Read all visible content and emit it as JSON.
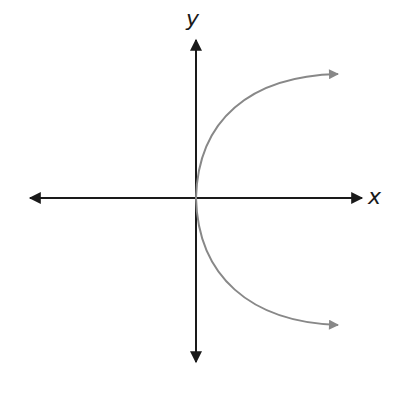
{
  "diagram": {
    "type": "graph of x = y^2 (sideways parabola)",
    "axes": {
      "x_label": "x",
      "y_label": "y",
      "color": "#1a1a1a"
    },
    "curve": {
      "description": "parabola opening to the right with vertex at origin, arrows on both ends",
      "color": "#888888"
    }
  }
}
